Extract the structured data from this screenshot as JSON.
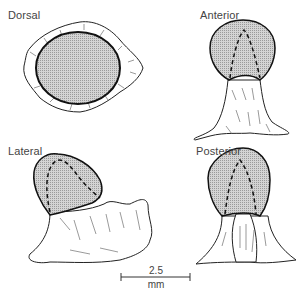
{
  "figure": {
    "views": [
      {
        "id": "dorsal",
        "label": "Dorsal"
      },
      {
        "id": "anterior",
        "label": "Anterior"
      },
      {
        "id": "lateral",
        "label": "Lateral"
      },
      {
        "id": "posterior",
        "label": "Posterior"
      }
    ],
    "scale_bar": {
      "value": "2.5",
      "unit": "mm"
    },
    "colors": {
      "stipple_fill": "#c8c8c8",
      "outline": "#111111",
      "background": "#ffffff"
    }
  }
}
